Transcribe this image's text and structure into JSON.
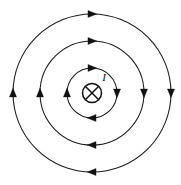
{
  "figure": {
    "background_color": "#ffffff",
    "line_color": "#1a1a1a",
    "center": {
      "x": 92,
      "y": 93
    },
    "current_label": "I",
    "current_direction": "into-page",
    "current_symbol": "circle-with-cross",
    "circulation": "clockwise",
    "symbol": {
      "name": "current-into-page-symbol",
      "radius": 10,
      "glyph": "cross-icon"
    },
    "field_lines": [
      {
        "name": "inner-field-line",
        "radius": 25,
        "arrows": [
          {
            "name": "arrow-top",
            "angle_deg": 270,
            "direction": "right"
          },
          {
            "name": "arrow-right",
            "angle_deg": 0,
            "direction": "down"
          },
          {
            "name": "arrow-bottom",
            "angle_deg": 90,
            "direction": "left"
          },
          {
            "name": "arrow-left",
            "angle_deg": 180,
            "direction": "up"
          }
        ]
      },
      {
        "name": "middle-field-line",
        "radius": 52,
        "arrows": [
          {
            "name": "arrow-top",
            "angle_deg": 270,
            "direction": "right"
          },
          {
            "name": "arrow-right",
            "angle_deg": 0,
            "direction": "down"
          },
          {
            "name": "arrow-bottom",
            "angle_deg": 90,
            "direction": "left"
          },
          {
            "name": "arrow-left",
            "angle_deg": 180,
            "direction": "up"
          }
        ]
      },
      {
        "name": "outer-field-line",
        "radius": 79,
        "arrows": [
          {
            "name": "arrow-top",
            "angle_deg": 270,
            "direction": "right"
          },
          {
            "name": "arrow-right",
            "angle_deg": 0,
            "direction": "down"
          },
          {
            "name": "arrow-bottom",
            "angle_deg": 90,
            "direction": "left"
          },
          {
            "name": "arrow-left",
            "angle_deg": 180,
            "direction": "up"
          }
        ]
      }
    ],
    "label_position": {
      "x": 104,
      "y": 81
    }
  }
}
